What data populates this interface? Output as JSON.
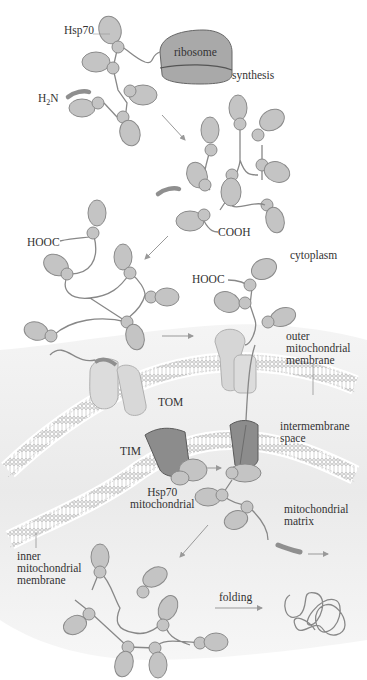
{
  "labels": {
    "hsp70_cyto": "Hsp70",
    "ribosome": "ribosome",
    "synthesis": "synthesis",
    "h2n_prefix": "H",
    "h2n_sub": "2",
    "h2n_suffix": "N",
    "cooh": "COOH",
    "hooc_left": "HOOC",
    "hooc_right": "HOOC",
    "cytoplasm": "cytoplasm",
    "outer_membrane": [
      "outer",
      "mitochondrial",
      "membrane"
    ],
    "tom": "TOM",
    "intermembrane": [
      "intermembrane",
      "space"
    ],
    "tim": "TIM",
    "hsp70_mito": [
      "Hsp70",
      "mitochondrial"
    ],
    "matrix": [
      "mitochondrial",
      "matrix"
    ],
    "inner_membrane": [
      "inner",
      "mitochondrial",
      "membrane"
    ],
    "folding": "folding"
  },
  "colors": {
    "protein_fill": "#c4c4c4",
    "protein_stroke": "#8a8a8a",
    "chain": "#888888",
    "ribosome_fill": "#a9a9a9",
    "signal_seq": "#8f8f8f",
    "tom_fill": "#dcdcdc",
    "tim_fill": "#8c8c8c",
    "mito_bg": "#ececec",
    "arrow": "#999999"
  }
}
